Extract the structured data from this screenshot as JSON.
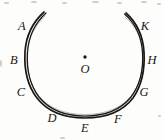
{
  "figure": {
    "name": "open-circular-arc-with-labeled-points",
    "background_color": "#fdfdfc",
    "ink_color": "#1a1714",
    "center": {
      "label": "O",
      "dot_x": 85,
      "dot_y": 57,
      "label_x": 85,
      "label_y": 69
    },
    "arc": {
      "description": "open circular arc, gap at top",
      "center_x": 85,
      "center_y": 66,
      "radius_x": 57,
      "radius_y": 54,
      "start_angle_deg": -109,
      "end_angle_deg": 110,
      "stroke_width": 1.6
    },
    "points": [
      {
        "label": "A",
        "x": 22,
        "y": 26
      },
      {
        "label": "B",
        "x": 14,
        "y": 60
      },
      {
        "label": "C",
        "x": 21,
        "y": 92
      },
      {
        "label": "D",
        "x": 52,
        "y": 118
      },
      {
        "label": "E",
        "x": 85,
        "y": 128
      },
      {
        "label": "F",
        "x": 118,
        "y": 119
      },
      {
        "label": "G",
        "x": 144,
        "y": 92
      },
      {
        "label": "H",
        "x": 152,
        "y": 60
      },
      {
        "label": "K",
        "x": 145,
        "y": 26
      }
    ],
    "specks": [
      {
        "x": 4,
        "y": 2,
        "w": 5,
        "h": 2
      },
      {
        "x": 31,
        "y": 1,
        "w": 6,
        "h": 2
      },
      {
        "x": 62,
        "y": 2,
        "w": 5,
        "h": 2
      },
      {
        "x": 92,
        "y": 1,
        "w": 7,
        "h": 2
      },
      {
        "x": 117,
        "y": 2,
        "w": 5,
        "h": 2
      },
      {
        "x": 141,
        "y": 1,
        "w": 6,
        "h": 2
      },
      {
        "x": 157,
        "y": 3,
        "w": 4,
        "h": 2
      },
      {
        "x": 0,
        "y": 60,
        "w": 2,
        "h": 7
      },
      {
        "x": 158,
        "y": 115,
        "w": 3,
        "h": 2
      },
      {
        "x": 60,
        "y": 137,
        "w": 5,
        "h": 2
      }
    ]
  }
}
